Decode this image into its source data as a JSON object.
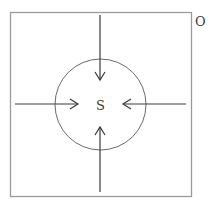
{
  "diagram": {
    "outer_label": "O",
    "inner_label": "S",
    "colors": {
      "box": "#9a9a9a",
      "circle": "#6a6a6a",
      "arrow": "#3a3a3a",
      "text": "#3a3a3a"
    },
    "arrows": [
      {
        "direction": "down",
        "from": "top"
      },
      {
        "direction": "up",
        "from": "bottom"
      },
      {
        "direction": "right",
        "from": "left"
      },
      {
        "direction": "left",
        "from": "right"
      }
    ]
  }
}
